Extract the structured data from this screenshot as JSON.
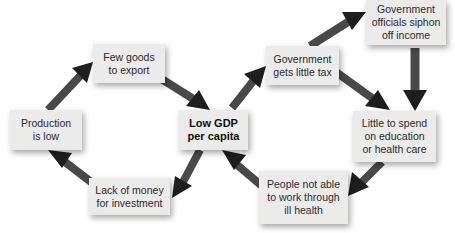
{
  "diagram": {
    "title": "",
    "colors": {
      "box": "#ebebea",
      "arrow": "#1e1e1e",
      "text": "#2a2a2a"
    },
    "nodes": {
      "low_gdp": {
        "label": "Low GDP\nper capita",
        "bold": true
      },
      "few_goods": {
        "label": "Few goods\nto export"
      },
      "production_low": {
        "label": "Production\nis low"
      },
      "lack_money": {
        "label": "Lack of money\nfor investment"
      },
      "gov_little_tax": {
        "label": "Government\ngets little tax"
      },
      "officials_siphon": {
        "label": "Government\nofficials siphon\noff income"
      },
      "little_to_spend": {
        "label": "Little to spend\non education\nor health care"
      },
      "people_not_able": {
        "label": "People not able\nto work through\nill health"
      }
    },
    "edges": [
      {
        "from": "Production is low",
        "to": "Few goods to export"
      },
      {
        "from": "Few goods to export",
        "to": "Low GDP per capita"
      },
      {
        "from": "Low GDP per capita",
        "to": "Lack of money for investment"
      },
      {
        "from": "Lack of money for investment",
        "to": "Production is low"
      },
      {
        "from": "Low GDP per capita",
        "to": "Government gets little tax"
      },
      {
        "from": "Government gets little tax",
        "to": "Government officials siphon off income"
      },
      {
        "from": "Government gets little tax",
        "to": "Little to spend on education or health care"
      },
      {
        "from": "Government officials siphon off income",
        "to": "Little to spend on education or health care"
      },
      {
        "from": "Little to spend on education or health care",
        "to": "People not able to work through ill health"
      },
      {
        "from": "People not able to work through ill health",
        "to": "Low GDP per capita"
      }
    ]
  }
}
